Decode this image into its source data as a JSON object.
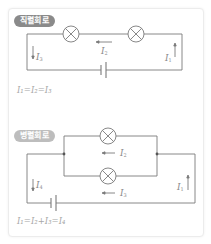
{
  "series": {
    "badge": "직렬회로",
    "labels": {
      "i1": "I",
      "i1_sub": "1",
      "i2": "I",
      "i2_sub": "2",
      "i3": "I",
      "i3_sub": "3"
    },
    "formula": "I₁=I₂=I₃"
  },
  "parallel": {
    "badge": "병렬회로",
    "labels": {
      "i1": "I",
      "i1_sub": "1",
      "i2": "I",
      "i2_sub": "2",
      "i3": "I",
      "i3_sub": "3",
      "i4": "I",
      "i4_sub": "4"
    },
    "formula": "I₁=I₂+I₃=I₄"
  },
  "colors": {
    "wire": "#7a7a7a",
    "series_badge": "#8a8a8a",
    "parallel_badge": "#bdbdbd",
    "text": "#8a8a8a"
  }
}
